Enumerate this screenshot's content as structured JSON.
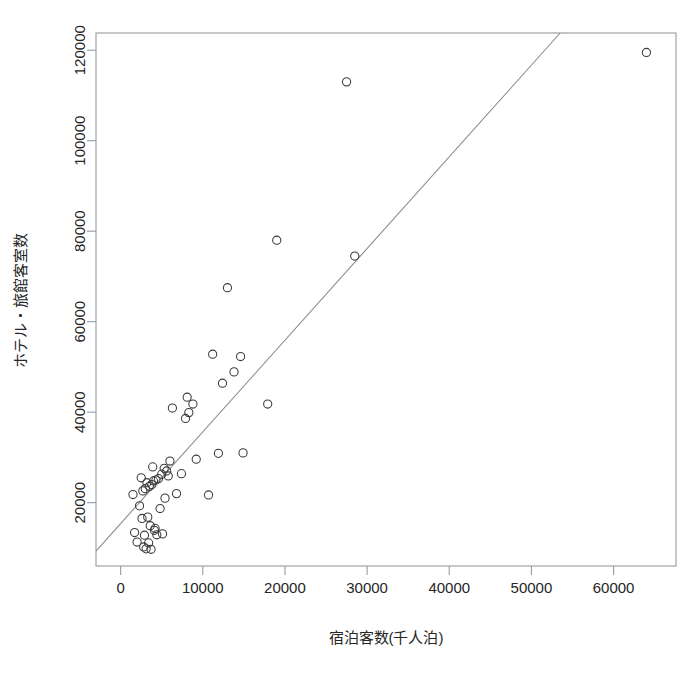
{
  "chart_data": {
    "type": "scatter",
    "title": "",
    "xlabel": "宿泊客数(千人泊)",
    "ylabel": "ホテル・旅館客室数",
    "xlim": [
      -3000,
      67600
    ],
    "ylim": [
      6000,
      123800
    ],
    "xticks": [
      0,
      10000,
      20000,
      30000,
      40000,
      50000,
      60000
    ],
    "xtick_labels": [
      "0",
      "10000",
      "20000",
      "30000",
      "40000",
      "50000",
      "60000"
    ],
    "yticks": [
      20000,
      40000,
      60000,
      80000,
      100000,
      120000
    ],
    "ytick_labels": [
      "20000",
      "40000",
      "60000",
      "80000",
      "100000",
      "120000"
    ],
    "grid": false,
    "legend": null,
    "marker": "open-circle",
    "marker_color": "#3a3a3a",
    "frame_color": "#9a9a9a",
    "line_color": "#8c8c8c",
    "points": [
      [
        1500,
        21800
      ],
      [
        1700,
        13400
      ],
      [
        2000,
        11300
      ],
      [
        2300,
        19300
      ],
      [
        2500,
        25500
      ],
      [
        2600,
        16500
      ],
      [
        2700,
        22600
      ],
      [
        2800,
        10200
      ],
      [
        2900,
        12800
      ],
      [
        3000,
        23100
      ],
      [
        3100,
        9800
      ],
      [
        3200,
        24400
      ],
      [
        3300,
        16800
      ],
      [
        3400,
        11100
      ],
      [
        3500,
        23600
      ],
      [
        3600,
        14900
      ],
      [
        3700,
        9700
      ],
      [
        3800,
        24000
      ],
      [
        3900,
        27900
      ],
      [
        4000,
        24800
      ],
      [
        4100,
        13900
      ],
      [
        4200,
        14300
      ],
      [
        4300,
        25000
      ],
      [
        4400,
        12900
      ],
      [
        4600,
        25300
      ],
      [
        4800,
        18700
      ],
      [
        5000,
        26300
      ],
      [
        5100,
        13100
      ],
      [
        5300,
        27600
      ],
      [
        5400,
        21000
      ],
      [
        5600,
        27000
      ],
      [
        5800,
        25900
      ],
      [
        6000,
        29200
      ],
      [
        6300,
        40900
      ],
      [
        6800,
        22000
      ],
      [
        7400,
        26400
      ],
      [
        7900,
        38600
      ],
      [
        8100,
        43300
      ],
      [
        8300,
        39900
      ],
      [
        8800,
        41800
      ],
      [
        9200,
        29600
      ],
      [
        10700,
        21700
      ],
      [
        11200,
        52800
      ],
      [
        11900,
        30900
      ],
      [
        12400,
        46400
      ],
      [
        13000,
        67500
      ],
      [
        13800,
        48900
      ],
      [
        14600,
        52300
      ],
      [
        14900,
        31000
      ],
      [
        17900,
        41800
      ],
      [
        19000,
        78000
      ],
      [
        27500,
        113000
      ],
      [
        28500,
        74500
      ],
      [
        64000,
        119500
      ]
    ],
    "regression_line": {
      "visible": true,
      "x_start": -3000,
      "y_start": 9300,
      "x_end": 53500,
      "y_end": 123800
    }
  },
  "figure": {
    "caption_faint": ""
  }
}
